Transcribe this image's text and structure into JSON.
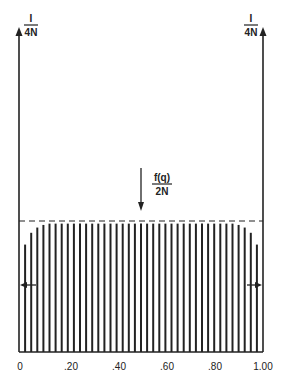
{
  "diagram": {
    "top_left_label": {
      "numerator": "I",
      "denominator": "4N"
    },
    "top_right_label": {
      "numerator": "I",
      "denominator": "4N"
    },
    "center_label": {
      "numerator": "f(q)",
      "denominator": "2N"
    },
    "x_ticks": [
      "0",
      ".20",
      ".40",
      ".60",
      ".80",
      "1.00"
    ],
    "x_range": [
      0,
      1
    ],
    "bar_count": 39,
    "bar_profile": {
      "plateau_relative_height": 0.98,
      "edge_relative_heights": [
        0.82,
        0.91,
        0.95,
        0.97
      ]
    },
    "dashed_reference_relative_height": 1.0,
    "ink_color": "#222222"
  }
}
